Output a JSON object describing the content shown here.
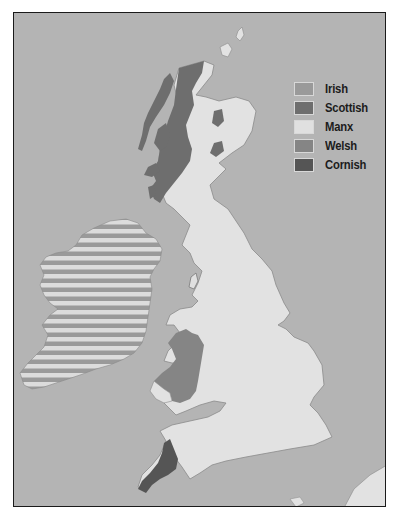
{
  "map": {
    "subject": "Celtic languages of the British Isles",
    "colors": {
      "sea": "#b4b4b4",
      "land_other": "#e2e2e2",
      "coast_line": "#8a8a8a",
      "irish_stripe_light": "#dcdcdc",
      "irish_stripe_dark": "#9a9a9a",
      "scottish": "#6e6e6e",
      "manx": "#e0e0e0",
      "welsh": "#858585",
      "cornish": "#555555",
      "frame": "#1a1a1a"
    }
  },
  "legend": {
    "items": [
      {
        "label": "Irish",
        "color": "#9a9a9a"
      },
      {
        "label": "Scottish",
        "color": "#6e6e6e"
      },
      {
        "label": "Manx",
        "color": "#e0e0e0"
      },
      {
        "label": "Welsh",
        "color": "#858585"
      },
      {
        "label": "Cornish",
        "color": "#555555"
      }
    ]
  }
}
